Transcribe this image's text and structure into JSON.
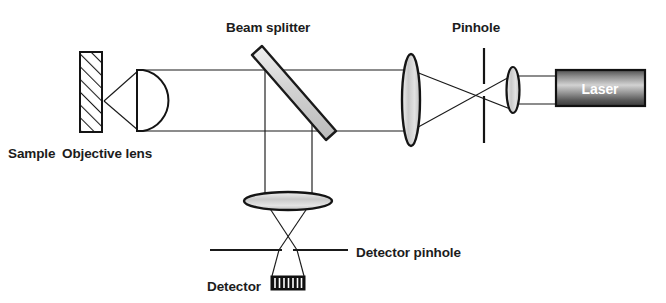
{
  "diagram": {
    "background_color": "#ffffff",
    "line_color": "#1a1a1a",
    "labels": {
      "sample": "Sample",
      "objective_lens": "Objective lens",
      "beam_splitter": "Beam splitter",
      "pinhole": "Pinhole",
      "laser": "Laser",
      "detector_pinhole": "Detector pinhole",
      "detector": "Detector"
    },
    "components": [
      {
        "name": "sample",
        "label": "Sample",
        "shape": "hatched-rectangle",
        "x": 80,
        "y": 52,
        "width": 22,
        "height": 80,
        "fill": "#ffffff",
        "stroke": "#141414"
      },
      {
        "name": "objective-lens",
        "label": "Objective lens",
        "shape": "plano-convex-lens",
        "x": 137,
        "y": 70,
        "width": 28,
        "height": 61,
        "fill": "#ffffff",
        "stroke": "#141414"
      },
      {
        "name": "beam-splitter",
        "label": "Beam splitter",
        "shape": "tilted-plate",
        "x1": 258,
        "y1": 50,
        "x2": 330,
        "y2": 134,
        "thickness": 11,
        "fill": "#d5d5d5",
        "stroke": "#1a1a1a"
      },
      {
        "name": "collimating-lens",
        "shape": "biconvex-lens",
        "cx": 411,
        "cy": 100,
        "rx": 9,
        "ry": 46,
        "fill": "#d8d8d8",
        "stroke": "#141414"
      },
      {
        "name": "pinhole",
        "label": "Pinhole",
        "shape": "vertical-slit",
        "x": 484,
        "y_top": 48,
        "y_bottom": 143,
        "gap_top": 84,
        "gap_bottom": 96,
        "stroke": "#141414"
      },
      {
        "name": "beam-expander-lens",
        "shape": "biconvex-lens",
        "cx": 513,
        "cy": 90,
        "rx": 6.5,
        "ry": 23,
        "fill": "#d8d8d8",
        "stroke": "#141414"
      },
      {
        "name": "laser",
        "label": "Laser",
        "shape": "gradient-box",
        "x": 556,
        "y": 70,
        "width": 89,
        "height": 36,
        "fill_start": "#4a4a4a",
        "fill_mid": "#bdbdbd",
        "fill_end": "#3a3a3a",
        "stroke": "#111111",
        "text_color": "#ffffff"
      },
      {
        "name": "detector-lens",
        "shape": "flat-ellipse-lens",
        "cx": 288,
        "cy": 201,
        "rx": 44,
        "ry": 9,
        "fill": "#d8d8d8",
        "stroke": "#141414"
      },
      {
        "name": "detector-pinhole",
        "label": "Detector pinhole",
        "shape": "horizontal-slit",
        "y": 250,
        "x_left": 210,
        "x_right": 348,
        "gap_left": 282,
        "gap_right": 293,
        "stroke": "#1a1a1a"
      },
      {
        "name": "detector",
        "label": "Detector",
        "shape": "striped-box",
        "x": 271,
        "y": 276,
        "width": 34,
        "height": 14,
        "fill": "#111111",
        "stripe_color": "#ffffff",
        "stripe_count": 7
      }
    ],
    "beams": {
      "collimated_top_y": 70,
      "collimated_bottom_y": 131,
      "focus_x_pinhole": 484,
      "focus_y_pinhole": 90,
      "sample_focus_x": 104,
      "sample_focus_y": 101,
      "detector_focus_x": 288,
      "detector_focus_y": 250
    },
    "label_positions": {
      "sample": {
        "x": 8,
        "y": 158
      },
      "objective_lens": {
        "x": 62,
        "y": 158
      },
      "beam_splitter": {
        "x": 226,
        "y": 32
      },
      "pinhole": {
        "x": 452,
        "y": 32
      },
      "laser": {
        "x": 575,
        "y": 95
      },
      "detector_pinhole": {
        "x": 356,
        "y": 257
      },
      "detector": {
        "x": 207,
        "y": 291
      }
    }
  }
}
